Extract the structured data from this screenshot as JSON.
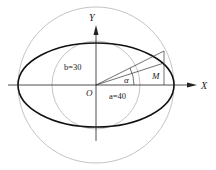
{
  "diagram": {
    "type": "ellipse-construction",
    "labels": {
      "x_axis": "X",
      "y_axis": "Y",
      "origin": "O",
      "point": "M",
      "angle": "α",
      "semi_minor": "b=30",
      "semi_major": "a=40"
    },
    "parameters": {
      "a": 40,
      "b": 30
    },
    "colors": {
      "ellipse": "#111111",
      "circles": "#bdbdbd",
      "axes": "#222222",
      "construction_lines": "#333333"
    }
  }
}
